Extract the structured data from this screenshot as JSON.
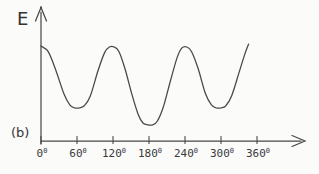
{
  "figure": {
    "panel_label": "(b)",
    "colors": {
      "line": "#4a4a4a",
      "text": "#3a3a3a",
      "background": "#fbfbfa"
    }
  },
  "chart_data": {
    "type": "line",
    "title": "",
    "xlabel": "",
    "ylabel": "E",
    "x_tick_labels": [
      "0⁰",
      "60⁰",
      "120⁰",
      "180⁰",
      "240⁰",
      "300⁰",
      "360⁰"
    ],
    "x_ticks_deg": [
      0,
      60,
      120,
      180,
      240,
      300,
      360
    ],
    "xlim": [
      0,
      435
    ],
    "ylim": [
      0,
      1.1
    ],
    "grid": false,
    "legend": false,
    "series": [
      {
        "name": "E",
        "points": [
          [
            0,
            1.0
          ],
          [
            12,
            0.94
          ],
          [
            25,
            0.74
          ],
          [
            38,
            0.5
          ],
          [
            48,
            0.38
          ],
          [
            56,
            0.35
          ],
          [
            64,
            0.35
          ],
          [
            72,
            0.37
          ],
          [
            82,
            0.47
          ],
          [
            95,
            0.74
          ],
          [
            106,
            0.93
          ],
          [
            114,
            0.99
          ],
          [
            122,
            0.99
          ],
          [
            130,
            0.94
          ],
          [
            140,
            0.76
          ],
          [
            152,
            0.48
          ],
          [
            162,
            0.28
          ],
          [
            170,
            0.19
          ],
          [
            178,
            0.17
          ],
          [
            186,
            0.17
          ],
          [
            194,
            0.21
          ],
          [
            204,
            0.36
          ],
          [
            216,
            0.64
          ],
          [
            227,
            0.88
          ],
          [
            235,
            0.98
          ],
          [
            243,
            0.99
          ],
          [
            251,
            0.94
          ],
          [
            262,
            0.76
          ],
          [
            274,
            0.5
          ],
          [
            284,
            0.38
          ],
          [
            292,
            0.35
          ],
          [
            300,
            0.35
          ],
          [
            308,
            0.37
          ],
          [
            318,
            0.48
          ],
          [
            330,
            0.72
          ],
          [
            340,
            0.92
          ],
          [
            346,
            1.02
          ]
        ]
      }
    ]
  }
}
